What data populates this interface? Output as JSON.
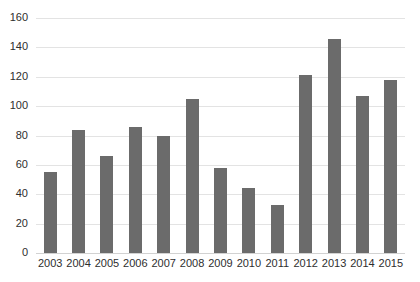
{
  "chart_data": {
    "type": "bar",
    "title": "",
    "subtitle": "",
    "xlabel": "",
    "ylabel": "",
    "categories": [
      "2003",
      "2004",
      "2005",
      "2006",
      "2007",
      "2008",
      "2009",
      "2010",
      "2011",
      "2012",
      "2013",
      "2014",
      "2015"
    ],
    "values": [
      55,
      84,
      66,
      86,
      80,
      105,
      58,
      44,
      33,
      121,
      146,
      107,
      118
    ],
    "ylim": [
      0,
      160
    ],
    "yticks": [
      0,
      20,
      40,
      60,
      80,
      100,
      120,
      140,
      160
    ],
    "ytick_labels": [
      "0",
      "20",
      "40",
      "60",
      "80",
      "100",
      "120",
      "140",
      "160"
    ],
    "grid": true,
    "legend": false,
    "legend_position": "none",
    "series": [
      {
        "name": "",
        "color": "#6b6b6b",
        "values": [
          55,
          84,
          66,
          86,
          80,
          105,
          58,
          44,
          33,
          121,
          146,
          107,
          118
        ]
      }
    ],
    "annotations": []
  },
  "colors": {
    "bar": "#6b6b6b",
    "gridline": "#e3e3e3",
    "baseline": "#d2d2d2",
    "text": "#2e2e2e",
    "background": "#ffffff"
  }
}
